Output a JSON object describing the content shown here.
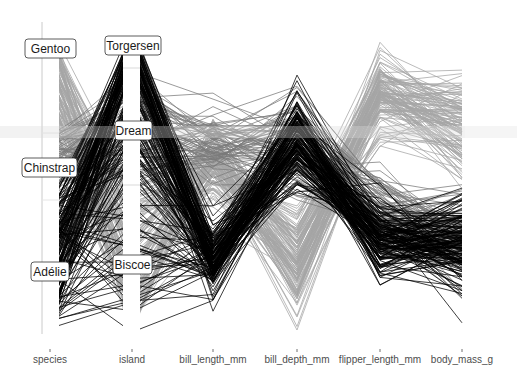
{
  "chart_data": {
    "type": "parallel_coordinates",
    "title": "",
    "xlabel": "",
    "ylabel": "",
    "axes": [
      "species",
      "island",
      "bill_length_mm",
      "bill_depth_mm",
      "flipper_length_mm",
      "body_mass_g"
    ],
    "categorical_axes": {
      "species": {
        "levels": [
          {
            "label": "Gentoo",
            "share": 0.36
          },
          {
            "label": "Chinstrap",
            "share": 0.2
          },
          {
            "label": "Adélie",
            "share": 0.44
          }
        ]
      },
      "island": {
        "levels": [
          {
            "label": "Torgersen",
            "share": 0.15
          },
          {
            "label": "Dream",
            "share": 0.36
          },
          {
            "label": "Biscoe",
            "share": 0.49
          }
        ]
      }
    },
    "series": [
      {
        "name": "Adélie",
        "color": "#000000",
        "count": 152,
        "typical": {
          "bill_length_mm": 38.8,
          "bill_depth_mm": 18.3,
          "flipper_length_mm": 190,
          "body_mass_g": 3700
        }
      },
      {
        "name": "Chinstrap",
        "color": "#7a7a7a",
        "count": 68,
        "typical": {
          "bill_length_mm": 48.8,
          "bill_depth_mm": 18.4,
          "flipper_length_mm": 196,
          "body_mass_g": 3733
        }
      },
      {
        "name": "Gentoo",
        "color": "#a6a6a6",
        "count": 124,
        "typical": {
          "bill_length_mm": 47.5,
          "bill_depth_mm": 15.0,
          "flipper_length_mm": 217,
          "body_mass_g": 5076
        }
      }
    ],
    "ranges": {
      "bill_length_mm": [
        32.1,
        59.6
      ],
      "bill_depth_mm": [
        13.1,
        21.5
      ],
      "flipper_length_mm": [
        172,
        231
      ],
      "body_mass_g": [
        2700,
        6300
      ]
    },
    "scale": "uniminmax",
    "grid": false,
    "legend": "none"
  },
  "axis_labels": {
    "species": "species",
    "island": "island",
    "bill_length_mm": "bill_length_mm",
    "bill_depth_mm": "bill_depth_mm",
    "flipper_length_mm": "flipper_length_mm",
    "body_mass_g": "body_mass_g"
  },
  "category_labels": {
    "gentoo": "Gentoo",
    "chinstrap": "Chinstrap",
    "adelie": "Adélie",
    "torgersen": "Torgersen",
    "dream": "Dream",
    "biscoe": "Biscoe"
  }
}
